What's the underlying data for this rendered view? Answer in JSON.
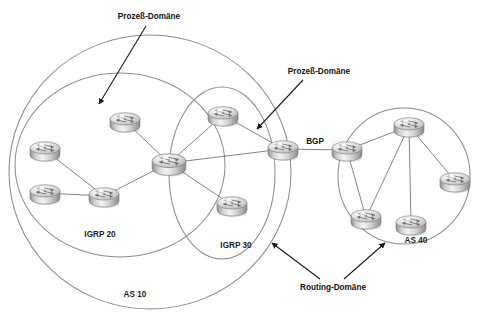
{
  "diagram": {
    "type": "network-topology",
    "background": "#ffffff",
    "colors": {
      "domain_outline": "#8d8d8d",
      "link": "#7d7d7d",
      "leader": "#1a1a1a",
      "text": "#111111",
      "router_body_light": "#ffffff",
      "router_body_mid": "#c8c8c8",
      "router_body_dark": "#8f8f8f"
    }
  },
  "domains": [
    {
      "id": "as10",
      "label": "AS 10",
      "kind": "autonomous-system",
      "label_x": 135,
      "label_y": 297,
      "cx": 150,
      "cy": 172,
      "rx": 141,
      "ry": 137
    },
    {
      "id": "igrp20",
      "label": "IGRP 20",
      "kind": "process-domain",
      "label_x": 100,
      "label_y": 237,
      "cx": 120,
      "cy": 165,
      "rx": 105,
      "ry": 92
    },
    {
      "id": "igrp30",
      "label": "IGRP 30",
      "kind": "process-domain",
      "label_x": 236,
      "label_y": 248,
      "cx": 222,
      "cy": 173,
      "rx": 53,
      "ry": 86
    },
    {
      "id": "as40",
      "label": "AS 40",
      "kind": "autonomous-system",
      "label_x": 416,
      "label_y": 243,
      "cx": 404,
      "cy": 176,
      "rx": 66,
      "ry": 68
    }
  ],
  "routers": [
    {
      "id": "r-as10-nw",
      "name": "router-igrp20-top",
      "x": 125,
      "y": 121,
      "scale": 1.0
    },
    {
      "id": "r-as10-w",
      "name": "router-igrp20-west",
      "x": 45,
      "y": 150,
      "scale": 1.0
    },
    {
      "id": "r-as10-sw",
      "name": "router-igrp20-southwest",
      "x": 45,
      "y": 193,
      "scale": 1.0
    },
    {
      "id": "r-as10-s",
      "name": "router-igrp20-south",
      "x": 104,
      "y": 196,
      "scale": 1.0
    },
    {
      "id": "r-hub",
      "name": "router-core-hub",
      "x": 169,
      "y": 163,
      "scale": 1.12
    },
    {
      "id": "r-igrp30-n",
      "name": "router-igrp30-north",
      "x": 223,
      "y": 115,
      "scale": 1.0
    },
    {
      "id": "r-igrp30-s",
      "name": "router-igrp30-south",
      "x": 232,
      "y": 205,
      "scale": 1.0
    },
    {
      "id": "r-bgp-left",
      "name": "router-bgp-border-as10",
      "x": 283,
      "y": 149,
      "scale": 1.0
    },
    {
      "id": "r-bgp-right",
      "name": "router-bgp-border-as40",
      "x": 347,
      "y": 150,
      "scale": 1.0
    },
    {
      "id": "r-as40-n",
      "name": "router-as40-north",
      "x": 409,
      "y": 126,
      "scale": 1.0
    },
    {
      "id": "r-as40-e",
      "name": "router-as40-east",
      "x": 455,
      "y": 181,
      "scale": 1.0
    },
    {
      "id": "r-as40-sw",
      "name": "router-as40-southwest",
      "x": 366,
      "y": 218,
      "scale": 1.0
    },
    {
      "id": "r-as40-s",
      "name": "router-as40-south",
      "x": 411,
      "y": 224,
      "scale": 1.0
    }
  ],
  "links": [
    {
      "from": "r-as10-nw",
      "to": "r-hub"
    },
    {
      "from": "r-as10-w",
      "to": "r-as10-s"
    },
    {
      "from": "r-as10-sw",
      "to": "r-as10-s"
    },
    {
      "from": "r-as10-s",
      "to": "r-hub"
    },
    {
      "from": "r-hub",
      "to": "r-igrp30-n"
    },
    {
      "from": "r-hub",
      "to": "r-igrp30-s"
    },
    {
      "from": "r-hub",
      "to": "r-bgp-left"
    },
    {
      "from": "r-igrp30-n",
      "to": "r-bgp-left"
    },
    {
      "from": "r-bgp-left",
      "to": "r-bgp-right",
      "label": "BGP"
    },
    {
      "from": "r-bgp-right",
      "to": "r-as40-n"
    },
    {
      "from": "r-bgp-right",
      "to": "r-as40-sw"
    },
    {
      "from": "r-as40-n",
      "to": "r-as40-e"
    },
    {
      "from": "r-as40-n",
      "to": "r-as40-sw"
    },
    {
      "from": "r-as40-n",
      "to": "r-as40-s"
    }
  ],
  "link_labels": [
    {
      "text": "BGP",
      "x": 315,
      "y": 144
    }
  ],
  "annotations": [
    {
      "id": "ann-prozess-1",
      "text": "Prozeß-Domäne",
      "text_x": 149,
      "text_y": 19,
      "anchor": "middle",
      "arrows": [
        {
          "x1": 146,
          "y1": 26,
          "x2": 99,
          "y2": 104
        }
      ]
    },
    {
      "id": "ann-prozess-2",
      "text": "Prozeß-Domäne",
      "text_x": 319,
      "text_y": 74,
      "anchor": "middle",
      "arrows": [
        {
          "x1": 303,
          "y1": 80,
          "x2": 257,
          "y2": 129
        }
      ]
    },
    {
      "id": "ann-routing",
      "text": "Routing-Domäne",
      "text_x": 333,
      "text_y": 290,
      "anchor": "middle",
      "arrows": [
        {
          "x1": 320,
          "y1": 279,
          "x2": 272,
          "y2": 243
        },
        {
          "x1": 344,
          "y1": 279,
          "x2": 385,
          "y2": 243
        }
      ]
    }
  ]
}
